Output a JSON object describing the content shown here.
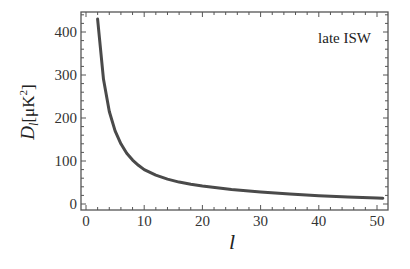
{
  "chart_data": {
    "type": "line",
    "title": "",
    "annotation": "late ISW",
    "xlabel": "l",
    "ylabel": "D_l [μK²]",
    "ylabel_parts": {
      "main": "D",
      "sub": "l",
      "unit_open": "[μK",
      "sup": "2",
      "unit_close": "]"
    },
    "xlim": [
      -1,
      52
    ],
    "ylim": [
      -15,
      445
    ],
    "xticks": [
      0,
      10,
      20,
      30,
      40,
      50
    ],
    "yticks": [
      0,
      100,
      200,
      300,
      400
    ],
    "grid": false,
    "legend": null,
    "series": [
      {
        "name": "late ISW",
        "color": "#4a4a4a",
        "x": [
          2,
          3,
          4,
          5,
          6,
          7,
          8,
          9,
          10,
          12,
          14,
          16,
          18,
          20,
          25,
          30,
          35,
          40,
          45,
          50,
          51
        ],
        "y": [
          430,
          290,
          215,
          170,
          140,
          118,
          102,
          90,
          80,
          67,
          58,
          51,
          46,
          42,
          34,
          28,
          23,
          19,
          16,
          14,
          13.5
        ]
      }
    ]
  }
}
